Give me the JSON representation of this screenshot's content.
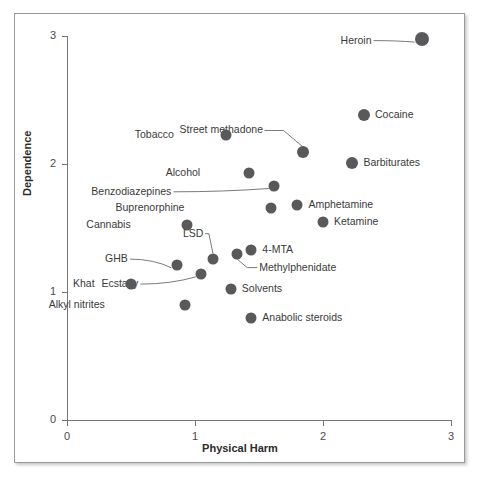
{
  "chart_data": {
    "type": "scatter",
    "title": "",
    "xlabel": "Physical Harm",
    "ylabel": "Dependence",
    "xlim": [
      0,
      3
    ],
    "ylim": [
      0,
      3
    ],
    "xticks": [
      "0",
      "1",
      "2",
      "3"
    ],
    "yticks": [
      "0",
      "1",
      "2",
      "3"
    ],
    "grid": false,
    "legend": "none",
    "point_color": "#59595b",
    "points": [
      {
        "label": "Heroin",
        "x": 2.77,
        "y": 2.98,
        "r": 7.0,
        "label_dx": -50,
        "label_dy": 2,
        "leader": true
      },
      {
        "label": "Cocaine",
        "x": 2.32,
        "y": 2.38,
        "r": 6.0,
        "label_dx": 11,
        "label_dy": 0,
        "leader": false
      },
      {
        "label": "Barbiturates",
        "x": 2.23,
        "y": 2.01,
        "r": 6.0,
        "label_dx": 11,
        "label_dy": 0,
        "leader": false
      },
      {
        "label": "Street methadone",
        "x": 1.84,
        "y": 2.09,
        "r": 6.0,
        "label_dx": -40,
        "label_dy": -22,
        "leader": true
      },
      {
        "label": "Tobacco",
        "x": 1.24,
        "y": 2.23,
        "r": 5.5,
        "label_dx": -52,
        "label_dy": 0,
        "leader": false
      },
      {
        "label": "Alcohol",
        "x": 1.42,
        "y": 1.93,
        "r": 5.5,
        "label_dx": -49,
        "label_dy": 0,
        "leader": false
      },
      {
        "label": "Benzodiazepines",
        "x": 1.62,
        "y": 1.83,
        "r": 5.5,
        "label_dx": -103,
        "label_dy": 6,
        "leader": true
      },
      {
        "label": "Buprenorphine",
        "x": 1.59,
        "y": 1.66,
        "r": 5.5,
        "label_dx": -86,
        "label_dy": 0,
        "leader": false
      },
      {
        "label": "Amphetamine",
        "x": 1.8,
        "y": 1.68,
        "r": 5.5,
        "label_dx": 11,
        "label_dy": 0,
        "leader": false
      },
      {
        "label": "Ketamine",
        "x": 2.0,
        "y": 1.55,
        "r": 5.5,
        "label_dx": 11,
        "label_dy": 0,
        "leader": false
      },
      {
        "label": "Cannabis",
        "x": 0.94,
        "y": 1.52,
        "r": 5.5,
        "label_dx": -57,
        "label_dy": 0,
        "leader": false
      },
      {
        "label": "LSD",
        "x": 1.14,
        "y": 1.26,
        "r": 5.5,
        "label_dx": -10,
        "label_dy": -25,
        "leader": true
      },
      {
        "label": "4-MTA",
        "x": 1.44,
        "y": 1.33,
        "r": 5.5,
        "label_dx": 11,
        "label_dy": 0,
        "leader": false
      },
      {
        "label": "Methylphenidate",
        "x": 1.33,
        "y": 1.3,
        "r": 5.5,
        "label_dx": 22,
        "label_dy": 14,
        "leader": true
      },
      {
        "label": "GHB",
        "x": 0.86,
        "y": 1.21,
        "r": 5.5,
        "label_dx": -49,
        "label_dy": -6,
        "leader": true
      },
      {
        "label": "Ecstasy",
        "x": 1.05,
        "y": 1.14,
        "r": 5.5,
        "label_dx": -63,
        "label_dy": 10,
        "leader": true
      },
      {
        "label": "Khat",
        "x": 0.5,
        "y": 1.06,
        "r": 5.5,
        "label_dx": -36,
        "label_dy": 0,
        "leader": false
      },
      {
        "label": "Solvents",
        "x": 1.28,
        "y": 1.02,
        "r": 5.5,
        "label_dx": 11,
        "label_dy": 0,
        "leader": false
      },
      {
        "label": "Alkyl nitrites",
        "x": 0.92,
        "y": 0.9,
        "r": 5.5,
        "label_dx": -80,
        "label_dy": 0,
        "leader": false
      },
      {
        "label": "Anabolic steroids",
        "x": 1.44,
        "y": 0.8,
        "r": 5.5,
        "label_dx": 11,
        "label_dy": 0,
        "leader": false
      }
    ]
  }
}
